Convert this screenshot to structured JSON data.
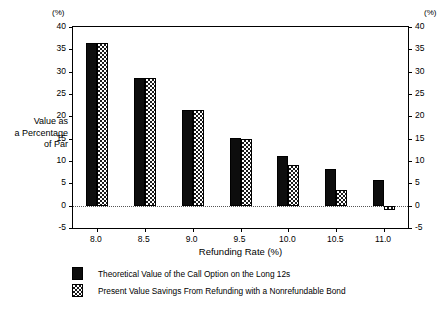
{
  "chart_data": {
    "type": "bar",
    "title": "",
    "xlabel": "Refunding Rate (%)",
    "ylabel": "Value as\na Percentage\nof Par",
    "y_unit_label": "(%)",
    "y_unit_label_right": "(%)",
    "categories": [
      "8.0",
      "8.5",
      "9.0",
      "9.5",
      "10.0",
      "10.5",
      "11.0"
    ],
    "series": [
      {
        "name": "Theoretical Value of the Call Option on the Long 12s",
        "pattern": "solid-black",
        "values": [
          36.5,
          28.6,
          21.5,
          15.2,
          11.1,
          8.3,
          5.8
        ]
      },
      {
        "name": "Present Value Savings From Refunding with a Nonrefundable Bond",
        "pattern": "checkered",
        "values": [
          36.5,
          28.6,
          21.5,
          15.0,
          9.0,
          3.5,
          -1.0
        ]
      }
    ],
    "ylim": [
      -5,
      40
    ],
    "yticks": [
      40,
      35,
      30,
      25,
      20,
      15,
      10,
      5,
      0,
      -5
    ],
    "ytick_labels": [
      "40",
      "35",
      "30",
      "25",
      "20",
      "15",
      "10",
      "5",
      "0",
      "-5"
    ],
    "ytick_labels_right": [
      "40",
      "35",
      "30",
      "25",
      "20",
      "15",
      "10",
      "5",
      "0",
      "-5"
    ],
    "grid": false,
    "zero_line": true,
    "zero_line_style": "dotted",
    "legend_position": "below",
    "axis_color": "#000000",
    "background": "#ffffff"
  },
  "legend": {
    "items": [
      {
        "label": "Theoretical Value of the Call Option on the Long 12s",
        "pattern": "solid-black"
      },
      {
        "label": "Present Value Savings From Refunding with a Nonrefundable Bond",
        "pattern": "checkered"
      }
    ]
  }
}
